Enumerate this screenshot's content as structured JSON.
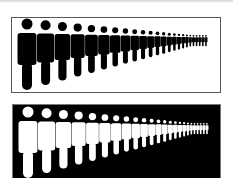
{
  "image": {
    "description": "Two panels showing rows of pictogram human figures diminishing in size toward the right (perspective crowd)",
    "panels": [
      {
        "id": "top",
        "background": "#ffffff",
        "figure_color": "#000000",
        "figure_count": 24
      },
      {
        "id": "bottom",
        "background": "#000000",
        "figure_color": "#ffffff",
        "figure_count": 24
      }
    ],
    "figure_layout": {
      "first_center_x": 15,
      "first_scale": 1.0,
      "shrink_ratio": 0.905,
      "min_scale": 0.16,
      "base_width": 19,
      "base_head_r": 5.5,
      "base_head_cy": 6,
      "base_body_top": 15,
      "base_body_h": 32,
      "base_leg_w": 10,
      "base_leg_h": 28,
      "base_gap": 0.5
    }
  }
}
